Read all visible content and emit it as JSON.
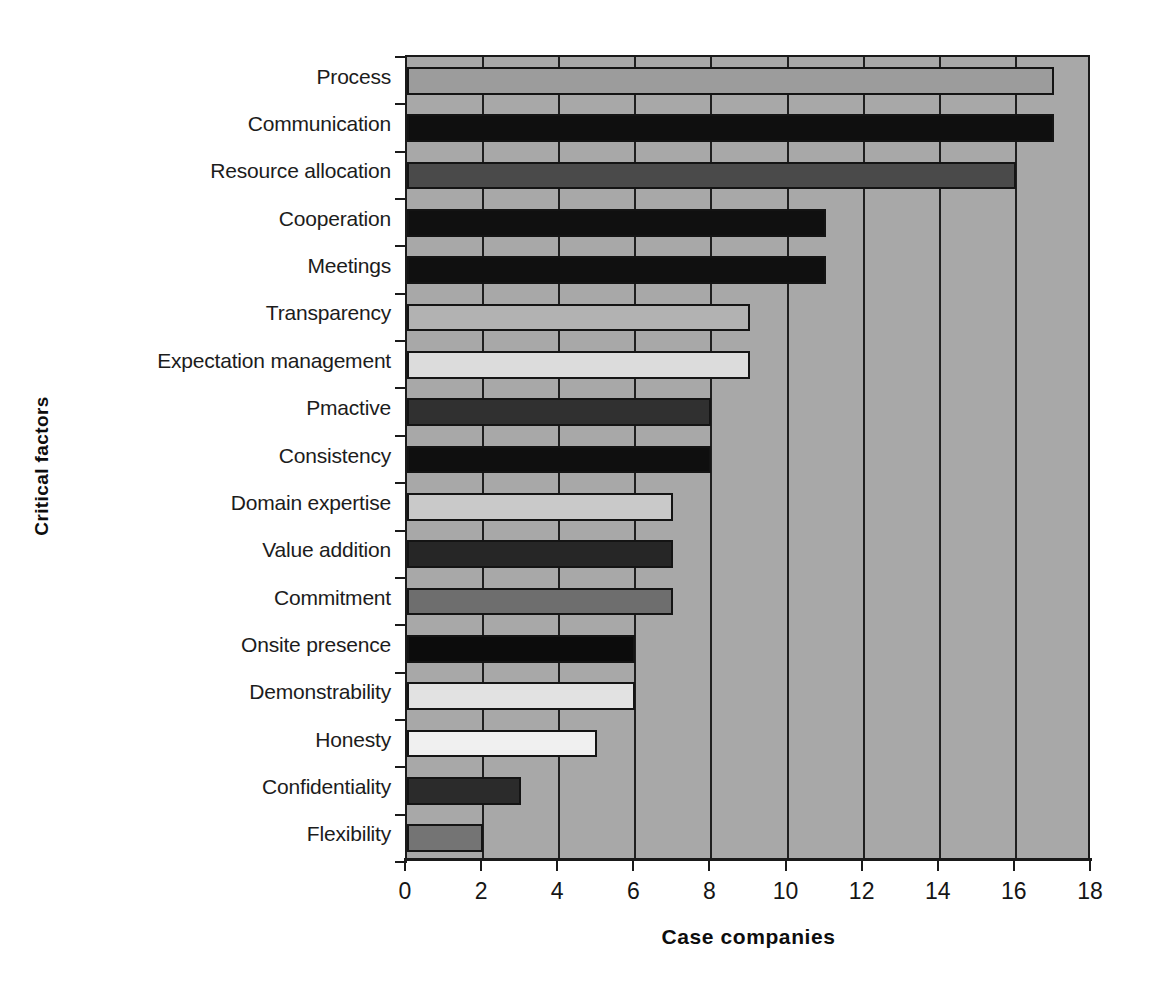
{
  "chart_data": {
    "type": "bar",
    "orientation": "horizontal",
    "title": "",
    "xlabel": "Case companies",
    "ylabel": "Critical factors",
    "xlim": [
      0,
      18
    ],
    "xticks": [
      0,
      2,
      4,
      6,
      8,
      10,
      12,
      14,
      16,
      18
    ],
    "grid": true,
    "legend": null,
    "plot_background": "#a8a8a8",
    "categories": [
      "Process",
      "Communication",
      "Resource allocation",
      "Cooperation",
      "Meetings",
      "Transparency",
      "Expectation management",
      "Pmactive",
      "Consistency",
      "Domain expertise",
      "Value addition",
      "Commitment",
      "Onsite presence",
      "Demonstrability",
      "Honesty",
      "Confidentiality",
      "Flexibility"
    ],
    "values": [
      17,
      17,
      16,
      11,
      11,
      9,
      9,
      8,
      8,
      7,
      7,
      7,
      6,
      6,
      5,
      3,
      2
    ],
    "bar_colors": [
      "#9c9c9c",
      "#0f0f0f",
      "#4a4a4a",
      "#101010",
      "#101010",
      "#b2b2b2",
      "#dcdcdc",
      "#303030",
      "#0f0f0f",
      "#c9c9c9",
      "#262626",
      "#6e6e6e",
      "#0c0c0c",
      "#e2e2e2",
      "#f0f0f0",
      "#2b2b2b",
      "#747474"
    ]
  }
}
